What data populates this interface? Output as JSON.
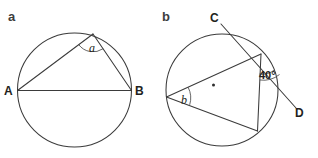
{
  "figure": {
    "background_color": "#ffffff",
    "stroke_color": "#3b3b3b",
    "text_color": "#231f20",
    "width": 318,
    "height": 158
  },
  "panels": [
    {
      "id": "panel-a",
      "label": "a",
      "description": "Circle with inscribed triangle on diameter AB, apex angle marked a",
      "circle": {
        "cx": 74.5,
        "cy": 90,
        "r": 57
      },
      "points": {
        "A": {
          "x": 17.5,
          "y": 90.5,
          "label": "A"
        },
        "B": {
          "x": 131.5,
          "y": 90.5,
          "label": "B"
        },
        "apex": {
          "x": 93,
          "y": 34
        }
      },
      "angle": {
        "name": "a",
        "label": "a",
        "vertex": "apex",
        "label_x": 92,
        "label_y": 51
      }
    },
    {
      "id": "panel-b",
      "label": "b",
      "description": "Circle with inscribed triangle and tangent line CD, tangent-chord angle 40 degrees, inscribed angle b",
      "circle": {
        "cx": 222,
        "cy": 90,
        "r": 56
      },
      "center_dot": {
        "x": 213.5,
        "y": 85
      },
      "points": {
        "C": {
          "x": 217,
          "y": 20,
          "label": "C"
        },
        "D": {
          "x": 299,
          "y": 112,
          "label": "D"
        },
        "left": {
          "x": 166.5,
          "y": 97
        },
        "top_right": {
          "x": 261,
          "y": 54
        },
        "bottom_right": {
          "x": 257.5,
          "y": 131
        }
      },
      "angles": [
        {
          "name": "angle-40",
          "label": "40°",
          "value": 40,
          "unit": "degrees",
          "vertex": "top_right",
          "label_x": 266,
          "label_y": 76
        },
        {
          "name": "b",
          "label": "b",
          "vertex": "left",
          "label_x": 184,
          "label_y": 103
        }
      ]
    }
  ]
}
